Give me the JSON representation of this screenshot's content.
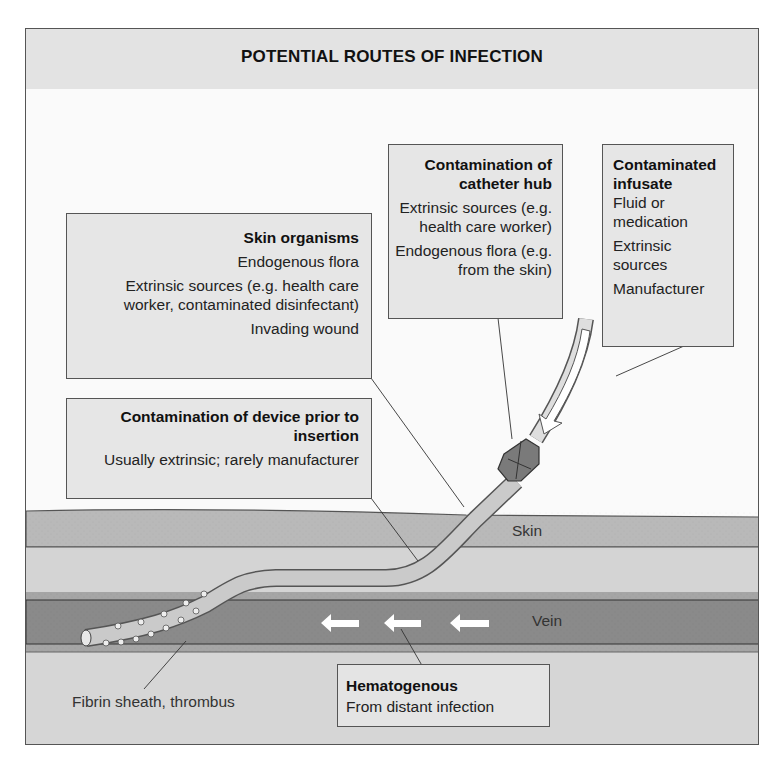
{
  "figure": {
    "title": "POTENTIAL ROUTES OF INFECTION",
    "colors": {
      "title_band": "#e3e3e3",
      "box_fill": "#e6e6e6",
      "skin": "#b9b9b9",
      "subcutaneous": "#d4d4d4",
      "vein": "#8a8a8a",
      "catheter": "#c9c9c9",
      "hub": "#777777",
      "arrow": "#ffffff"
    }
  },
  "boxes": {
    "skin_organisms": {
      "heading": "Skin organisms",
      "lines": [
        "Endogenous flora",
        "Extrinsic sources (e.g. health care worker, contaminated disinfectant)",
        "Invading wound"
      ]
    },
    "catheter_hub": {
      "heading": "Contamination of catheter hub",
      "lines": [
        "Extrinsic sources (e.g. health care worker)",
        "Endogenous flora (e.g. from the skin)"
      ]
    },
    "infusate": {
      "heading": "Contaminated infusate",
      "lines": [
        "Fluid or medication",
        "Extrinsic sources",
        "Manufacturer"
      ]
    },
    "device": {
      "heading": "Contamination of device prior to insertion",
      "lines": [
        "Usually extrinsic; rarely manufacturer"
      ]
    },
    "hematogenous": {
      "heading": "Hematogenous",
      "lines": [
        "From distant infection"
      ]
    }
  },
  "labels": {
    "skin": "Skin",
    "vein": "Vein",
    "fibrin": "Fibrin sheath, thrombus"
  },
  "icons": {
    "flow_arrow": "left-arrow",
    "infusate_arrow": "down-arrow"
  }
}
